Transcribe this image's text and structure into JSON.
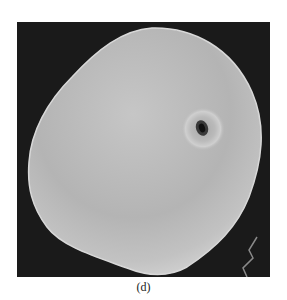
{
  "figure": {
    "caption": "(d)",
    "background_color": "#1a1a1a",
    "grain_color": "#bdbdbd"
  }
}
